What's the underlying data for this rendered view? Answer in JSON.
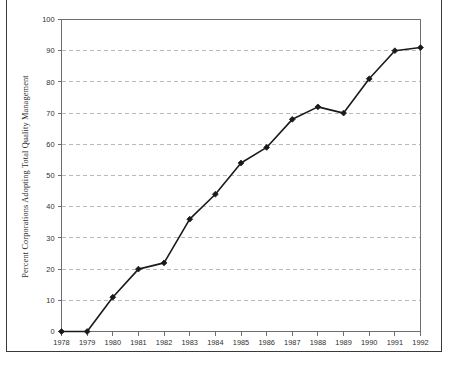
{
  "chart_data": {
    "type": "line",
    "title": "",
    "xlabel": "",
    "ylabel": "Percent Corporations Adopting Total Quality Management",
    "categories": [
      "1978",
      "1979",
      "1980",
      "1981",
      "1982",
      "1983",
      "1984",
      "1985",
      "1986",
      "1987",
      "1988",
      "1989",
      "1990",
      "1991",
      "1992"
    ],
    "x": [
      1978,
      1979,
      1980,
      1981,
      1982,
      1983,
      1984,
      1985,
      1986,
      1987,
      1988,
      1989,
      1990,
      1991,
      1992
    ],
    "values": [
      0,
      0,
      11,
      20,
      22,
      36,
      44,
      54,
      59,
      68,
      72,
      70,
      81,
      90,
      91
    ],
    "series": [
      {
        "name": "Percent Corporations Adopting Total Quality Management",
        "values": [
          0,
          0,
          11,
          20,
          22,
          36,
          44,
          54,
          59,
          68,
          72,
          70,
          81,
          90,
          91
        ]
      }
    ],
    "ylim": [
      0,
      100
    ],
    "xlim": [
      1978,
      1992
    ],
    "ytick_labels": [
      "0",
      "10",
      "20",
      "30",
      "40",
      "50",
      "60",
      "70",
      "80",
      "90",
      "100"
    ],
    "ytick_values": [
      0,
      10,
      20,
      30,
      40,
      50,
      60,
      70,
      80,
      90,
      100
    ],
    "xtick_labels": [
      "1978",
      "1979",
      "1980",
      "1981",
      "1982",
      "1983",
      "1984",
      "1985",
      "1986",
      "1987",
      "1988",
      "1989",
      "1990",
      "1991",
      "1992"
    ],
    "grid": "horizontal-dashed",
    "legend": "none",
    "marker": "filled-diamond",
    "line_color": "#1a1a1a",
    "grid_color": "#b9b9b9",
    "axis_color": "#6e6e6e",
    "background": "#ffffff"
  }
}
